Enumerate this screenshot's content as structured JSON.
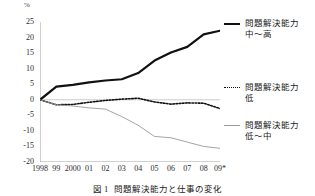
{
  "chart_data": {
    "type": "line",
    "title": "問題解決能力と仕事の変化",
    "figure_number": "図 1",
    "unit_label": "%",
    "xlabel": "",
    "ylabel": "",
    "grid": false,
    "legend_position": "right",
    "categories": [
      "1998",
      "99",
      "2000",
      "01",
      "02",
      "03",
      "04",
      "05",
      "06",
      "07",
      "08",
      "09*"
    ],
    "xtick_labels": [
      "1998",
      "99",
      "2000",
      "01",
      "02",
      "03",
      "04",
      "05",
      "06",
      "07",
      "08",
      "09*"
    ],
    "ytick_labels": [
      "25",
      "20",
      "15",
      "10",
      "5",
      "0",
      "-5",
      "-10",
      "-15",
      "-20"
    ],
    "ylim": [
      -20,
      25
    ],
    "ytick_step": 5,
    "series": [
      {
        "name": "問題解決能力 中〜高",
        "name_line1": "問題解決能力",
        "name_line2": "中〜高",
        "style": "solid-thick",
        "color": "#111111",
        "values": [
          0,
          4.2,
          4.8,
          5.6,
          6.2,
          6.6,
          8.6,
          12.6,
          15.2,
          17.0,
          21.0,
          22.2
        ]
      },
      {
        "name": "問題解決能力 低",
        "name_line1": "問題解決能力",
        "name_line2": "低",
        "style": "dotted",
        "color": "#111111",
        "values": [
          0,
          -1.6,
          -1.5,
          -0.8,
          -0.2,
          0.2,
          0.5,
          -0.7,
          -1.4,
          -1.0,
          -1.1,
          -2.8
        ]
      },
      {
        "name": "問題解決能力 低〜中",
        "name_line1": "問題解決能力",
        "name_line2": "低〜中",
        "style": "solid-thin",
        "color": "#9a9a9a",
        "values": [
          0,
          -1.6,
          -2.0,
          -2.6,
          -3.0,
          -5.4,
          -8.2,
          -11.8,
          -12.2,
          -13.6,
          -15.0,
          -15.6
        ]
      }
    ]
  }
}
